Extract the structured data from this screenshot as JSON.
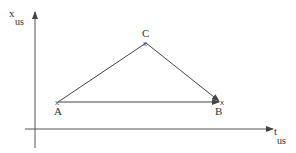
{
  "diagram": {
    "y_axis_label": {
      "main": "x",
      "sub": "us"
    },
    "x_axis_label": {
      "main": "t",
      "sub": "us"
    },
    "points": [
      {
        "name": "A",
        "x": 58,
        "y": 102
      },
      {
        "name": "B",
        "x": 221,
        "y": 102
      },
      {
        "name": "C",
        "x": 146,
        "y": 43
      }
    ],
    "edges": [
      {
        "from": "A",
        "to": "C",
        "arrow": false
      },
      {
        "from": "C",
        "to": "B",
        "arrow": true
      },
      {
        "from": "A",
        "to": "B",
        "arrow": true
      }
    ],
    "line_color": "#444444"
  }
}
